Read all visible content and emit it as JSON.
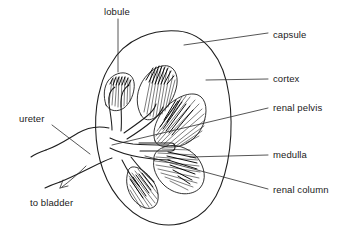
{
  "figure": {
    "type": "anatomical-diagram",
    "background_color": "#ffffff",
    "line_color": "#1d1d1d",
    "text_color": "#1a1a1a"
  },
  "labels": {
    "lobule": "lobule",
    "capsule": "capsule",
    "cortex": "cortex",
    "renal_pelvis": "renal pelvis",
    "medulla": "medulla",
    "renal_column": "renal column",
    "ureter": "ureter",
    "to_bladder": "to bladder"
  },
  "annotations": [
    {
      "id": "lobule",
      "text": "lobule",
      "side": "top",
      "text_x": 104,
      "text_y": 15,
      "leader": "M118,19 L118,72"
    },
    {
      "id": "capsule",
      "text": "capsule",
      "side": "right",
      "text_x": 273,
      "text_y": 38,
      "leader": "M184,45 L268,33"
    },
    {
      "id": "cortex",
      "text": "cortex",
      "side": "right",
      "text_x": 273,
      "text_y": 82,
      "leader": "M206,80 L268,79"
    },
    {
      "id": "renal pelvis",
      "text": "renal pelvis",
      "side": "right",
      "text_x": 273,
      "text_y": 110,
      "leader": "M112,145 L268,108"
    },
    {
      "id": "medulla",
      "text": "medulla",
      "side": "right",
      "text_x": 273,
      "text_y": 158,
      "leader": "M190,157 L268,155"
    },
    {
      "id": "renal column",
      "text": "renal column",
      "side": "right",
      "text_x": 273,
      "text_y": 193,
      "leader": "M145,156 L268,189"
    },
    {
      "id": "ureter",
      "text": "ureter",
      "side": "left",
      "text_x": 19,
      "text_y": 122,
      "leader": "M52,125 L90,154"
    },
    {
      "id": "to bladder",
      "text": "to bladder",
      "side": "left",
      "text_x": 30,
      "text_y": 205,
      "leader": "M86,165 L60,188",
      "arrow": true
    }
  ]
}
